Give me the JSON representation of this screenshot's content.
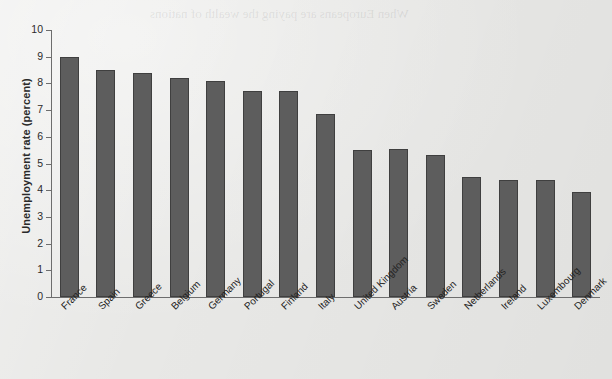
{
  "page": {
    "background_color": "#e8e8e6",
    "bleed_through_text": "When Europeans are paying the wealth of nations"
  },
  "chart_data": {
    "type": "bar",
    "title": "",
    "xlabel": "",
    "ylabel": "Unemployment rate (percent)",
    "ylim": [
      0,
      10
    ],
    "ytick_labels": [
      "0",
      "1",
      "2",
      "3",
      "4",
      "5",
      "6",
      "7",
      "8",
      "9",
      "10"
    ],
    "ytick_values": [
      0,
      1,
      2,
      3,
      4,
      5,
      6,
      7,
      8,
      9,
      10
    ],
    "grid": false,
    "legend": null,
    "bar_color": "#5d5d5d",
    "bar_edge_color": "#3f3f3f",
    "axis_color": "#6d6d6d",
    "categories": [
      "France",
      "Spain",
      "Greece",
      "Belgium",
      "Germany",
      "Portugal",
      "Finland",
      "Italy",
      "United Kingdom",
      "Austria",
      "Sweden",
      "Netherlands",
      "Ireland",
      "Luxembourg",
      "Denmark"
    ],
    "values": [
      9.0,
      8.5,
      8.4,
      8.2,
      8.1,
      7.7,
      7.7,
      6.85,
      5.5,
      5.55,
      5.3,
      4.5,
      4.4,
      4.4,
      3.95
    ]
  }
}
